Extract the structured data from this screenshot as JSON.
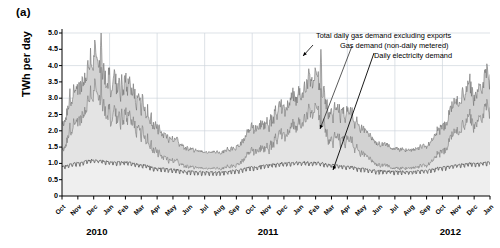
{
  "panel": {
    "label": "(a)"
  },
  "axes": {
    "ylabel": "TWh per day",
    "yticks": [
      "5.0",
      "4.5",
      "4.0",
      "3.5",
      "3.0",
      "2.5",
      "2.0",
      "1.5",
      "1.0",
      "0.5",
      "0"
    ],
    "ylim": [
      0,
      5.0
    ],
    "months": [
      "Oct",
      "Nov",
      "Dec",
      "Jan",
      "Feb",
      "Mar",
      "Apr",
      "May",
      "Jun",
      "Jul",
      "Aug",
      "Sep",
      "Oct",
      "Nov",
      "Dec",
      "Jan",
      "Feb",
      "Mar",
      "Apr",
      "May",
      "Jun",
      "Jul",
      "Aug",
      "Sep",
      "Oct",
      "Nov",
      "Dec",
      "Jan"
    ],
    "years": [
      "2010",
      "2011",
      "2012"
    ]
  },
  "annotations": {
    "total_gas": "Total daily gas demand excluding exports",
    "ndm_gas": "Gas demand (non-daily metered)",
    "electricity": "Daily electricity demand"
  },
  "colors": {
    "total_gas_line": "#6e6e6e",
    "total_gas_fill": "#d2d2d2",
    "ndm_gas_line": "#7a7a7a",
    "ndm_gas_fill": "#e4e4e4",
    "electricity_line": "#4a4a4a",
    "electricity_fill": "#efefef",
    "grid": "#cfd6dd",
    "axis": "#000000",
    "background": "#ffffff"
  },
  "chart_data": {
    "type": "area",
    "title": "",
    "xlabel": "",
    "ylabel": "TWh per day",
    "ylim": [
      0,
      5.0
    ],
    "grid": true,
    "legend_position": "inline-annotations",
    "x_start": "2010-10-01",
    "x_end": "2013-01-15",
    "x_tick_labels": [
      "Oct",
      "Nov",
      "Dec",
      "Jan",
      "Feb",
      "Mar",
      "Apr",
      "May",
      "Jun",
      "Jul",
      "Aug",
      "Sep",
      "Oct",
      "Nov",
      "Dec",
      "Jan",
      "Feb",
      "Mar",
      "Apr",
      "May",
      "Jun",
      "Jul",
      "Aug",
      "Sep",
      "Oct",
      "Nov",
      "Dec",
      "Jan"
    ],
    "monthly_means": {
      "note": "Approximate monthly mean values read from the figure, TWh per day",
      "months": [
        "2010-10",
        "2010-11",
        "2010-12",
        "2011-01",
        "2011-02",
        "2011-03",
        "2011-04",
        "2011-05",
        "2011-06",
        "2011-07",
        "2011-08",
        "2011-09",
        "2011-10",
        "2011-11",
        "2011-12",
        "2012-01",
        "2012-02",
        "2012-03",
        "2012-04",
        "2012-05",
        "2012-06",
        "2012-07",
        "2012-08",
        "2012-09",
        "2012-10",
        "2012-11",
        "2012-12",
        "2013-01"
      ],
      "series": [
        {
          "name": "Total daily gas demand excluding exports",
          "values": [
            2.25,
            3.25,
            4.25,
            3.45,
            3.3,
            2.85,
            2.1,
            1.7,
            1.45,
            1.35,
            1.35,
            1.5,
            2.05,
            2.25,
            2.8,
            3.1,
            3.6,
            2.6,
            2.55,
            2.0,
            1.6,
            1.45,
            1.4,
            1.55,
            2.1,
            2.85,
            3.3,
            3.7
          ]
        },
        {
          "name": "Gas demand (non-daily metered)",
          "values": [
            1.45,
            2.25,
            3.2,
            2.45,
            2.35,
            1.95,
            1.35,
            1.05,
            0.9,
            0.85,
            0.85,
            0.95,
            1.35,
            1.5,
            1.95,
            2.2,
            2.6,
            1.75,
            1.7,
            1.25,
            0.95,
            0.85,
            0.85,
            0.95,
            1.35,
            1.95,
            2.35,
            2.7
          ]
        },
        {
          "name": "Daily electricity demand",
          "values": [
            0.88,
            0.98,
            1.08,
            1.02,
            1.0,
            0.93,
            0.82,
            0.78,
            0.72,
            0.7,
            0.7,
            0.75,
            0.85,
            0.92,
            0.98,
            1.0,
            1.0,
            0.92,
            0.88,
            0.8,
            0.74,
            0.72,
            0.72,
            0.76,
            0.85,
            0.93,
            0.97,
            1.0
          ]
        }
      ]
    },
    "peaks": {
      "total_gas_max": 5.0,
      "total_gas_max_date": "2010-12",
      "secondary_peak": 4.5,
      "secondary_peak_date": "2012-02",
      "summer_min": 1.1
    }
  }
}
